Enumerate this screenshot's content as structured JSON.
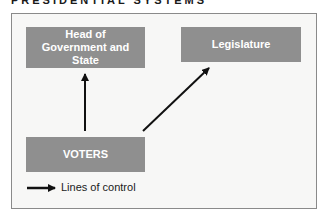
{
  "title": "PRESIDENTIAL SYSTEMS",
  "boxes": {
    "head": "Head of Government and State",
    "legislature": "Legislature",
    "voters": "VOTERS"
  },
  "legend": {
    "label": "Lines of control",
    "icon": "arrow-right-icon"
  },
  "edges": [
    {
      "from": "VOTERS",
      "to": "Head of Government and State"
    },
    {
      "from": "VOTERS",
      "to": "Legislature"
    }
  ],
  "colors": {
    "box_fill": "#8f8f8f",
    "box_text": "#ffffff",
    "frame_bg": "#f7f7f6",
    "arrow": "#111111"
  }
}
